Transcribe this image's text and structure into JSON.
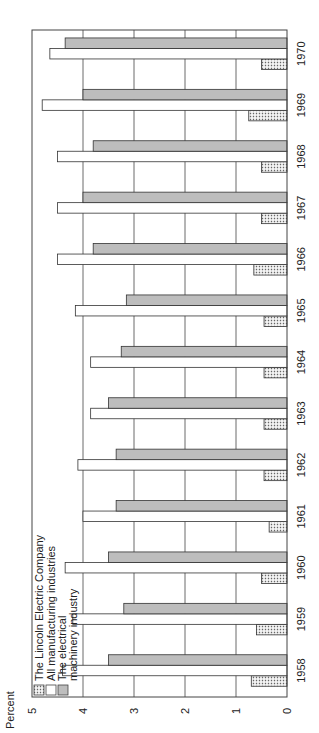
{
  "chart_data": {
    "type": "bar",
    "orientation": "rotated-90-ccw",
    "title": "",
    "ylabel": "Percent",
    "xlabel": "",
    "ylim": [
      0,
      5
    ],
    "yticks": [
      0,
      1,
      2,
      3,
      4,
      5
    ],
    "grid": true,
    "legend_position": "upper-left-inside",
    "categories": [
      "1958",
      "1959",
      "1960",
      "1961",
      "1962",
      "1963",
      "1964",
      "1965",
      "1966",
      "1967",
      "1968",
      "1969",
      "1970"
    ],
    "series": [
      {
        "name": "The Lincoln Electric Company",
        "pattern": "dotted",
        "color": "#d8d8d8",
        "values": [
          0.7,
          0.6,
          0.5,
          0.35,
          0.45,
          0.45,
          0.45,
          0.45,
          0.65,
          0.5,
          0.5,
          0.75,
          0.5
        ]
      },
      {
        "name": "All manufacturing industries",
        "pattern": "white",
        "color": "#ffffff",
        "values": [
          4.4,
          4.2,
          4.35,
          4.0,
          4.1,
          3.85,
          3.85,
          4.15,
          4.5,
          4.5,
          4.5,
          4.8,
          4.65
        ]
      },
      {
        "name": "The electrical machinery industry",
        "pattern": "gray",
        "color": "#bdbdbd",
        "values": [
          3.5,
          3.2,
          3.5,
          3.35,
          3.35,
          3.5,
          3.25,
          3.15,
          3.8,
          4.0,
          3.8,
          4.0,
          4.35
        ]
      }
    ]
  },
  "legend": {
    "items": [
      {
        "label": "The Lincoln Electric Company"
      },
      {
        "label": "All manufacturing industries"
      },
      {
        "label": "The electrical",
        "label2": "machinery industry"
      }
    ]
  },
  "axis": {
    "ylabel": "Percent",
    "ticks": [
      "0",
      "1",
      "2",
      "3",
      "4",
      "5"
    ]
  }
}
